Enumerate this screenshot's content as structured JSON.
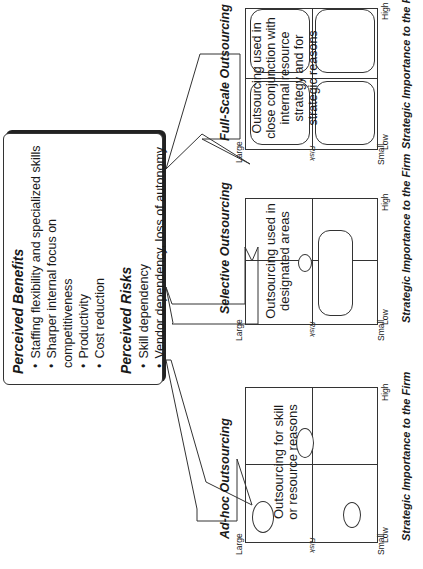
{
  "info_box": {
    "benefits_heading": "Perceived Benefits",
    "benefits": [
      "Staffing flexibility and specialized skills",
      "Sharper internal focus on competitiveness",
      "Productivity",
      "Cost reduction"
    ],
    "risks_heading": "Perceived Risks",
    "risks": [
      "Skill dependency",
      "Vendor dependency, loss of autonomy"
    ]
  },
  "charts": [
    {
      "title": "Ad-hoc Outsourcing",
      "text": "Outsourcing for skill or resource reasons",
      "x_axis_label": "Strategic Importance to the Firm",
      "x_low": "Low",
      "x_high": "High",
      "y_axis_label": "Risk",
      "y_large": "Large",
      "y_small": "Small"
    },
    {
      "title": "Selective Outsourcing",
      "text": "Outsourcing used in designated areas",
      "x_axis_label": "Strategic Importance to the Firm",
      "x_low": "Low",
      "x_high": "High",
      "y_axis_label": "Risk",
      "y_large": "Large",
      "y_small": "Small"
    },
    {
      "title": "Full-Scale Outsourcing",
      "text": "Outsourcing used in close conjunction with internal resource strategy and for strategic reasons",
      "x_axis_label": "Strategic Importance to the Firm",
      "x_low": "Low",
      "x_high": "High",
      "y_axis_label": "Risk",
      "y_large": "Large",
      "y_small": "Small"
    }
  ],
  "colors": {
    "line": "#333333",
    "background": "#ffffff"
  }
}
